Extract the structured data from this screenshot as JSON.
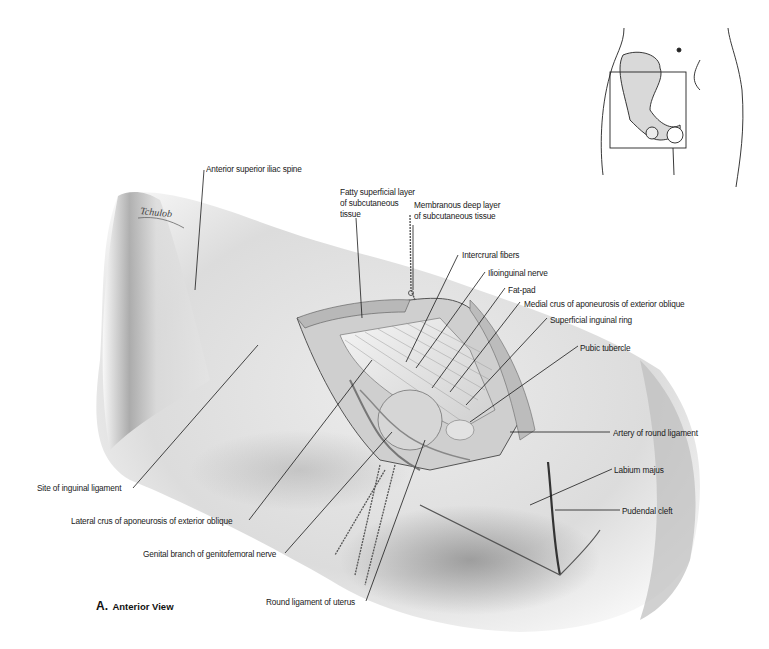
{
  "figure": {
    "caption_letter": "A.",
    "caption_view": "Anterior View",
    "signature": "Tchulob"
  },
  "labels": {
    "anterior_superior_iliac_spine": "Anterior superior iliac spine",
    "fatty_superficial_layer": "Fatty superficial layer\nof subcutaneous\ntissue",
    "membranous_deep_layer": "Membranous deep layer\nof subcutaneous tissue",
    "intercrural_fibers": "Intercrural fibers",
    "ilioinguinal_nerve": "Ilioinguinal nerve",
    "fat_pad": "Fat-pad",
    "medial_crus": "Medial crus of aponeurosis of exterior oblique",
    "superficial_inguinal_ring": "Superficial inguinal ring",
    "pubic_tubercle": "Pubic tubercle",
    "artery_of_round_ligament": "Artery of round ligament",
    "labium_majus": "Labium majus",
    "pudendal_cleft": "Pudendal cleft",
    "site_of_inguinal_ligament": "Site of inguinal ligament",
    "lateral_crus": "Lateral crus of aponeurosis of exterior oblique",
    "genital_branch": "Genital branch of genitofemoral nerve",
    "round_ligament_of_uterus": "Round ligament of uterus"
  },
  "colors": {
    "skin_light": "#f2f2f2",
    "skin_shadow": "#8a8a8a",
    "ink": "#1a1a1a",
    "bone_fill": "#d9d9d9"
  }
}
